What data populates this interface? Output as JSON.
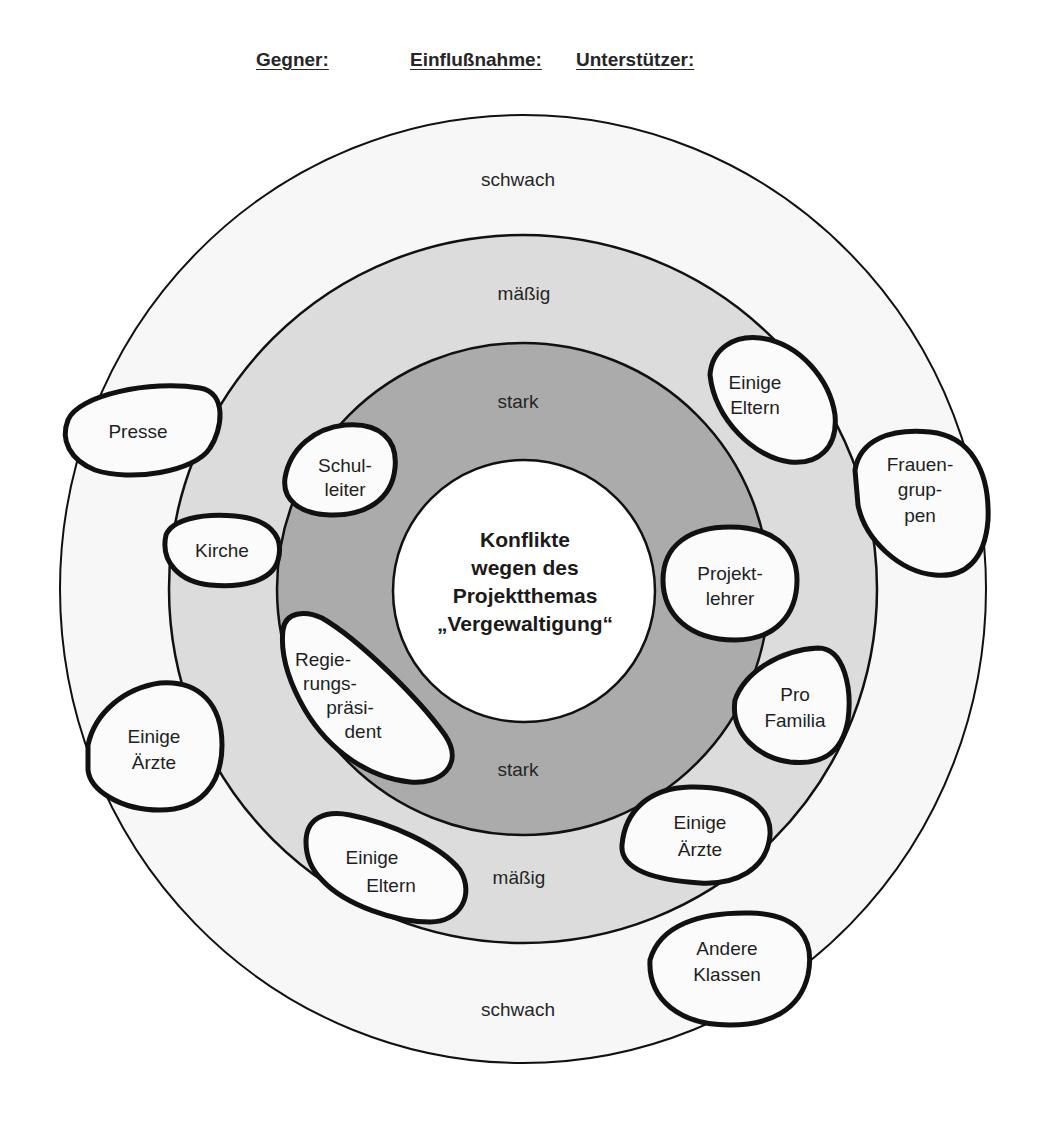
{
  "header": {
    "gegner": "Gegner:",
    "einflussnahme": "Einflußnahme:",
    "unterstuetzer": "Unterstützer:"
  },
  "rings": {
    "outer": "schwach",
    "middle": "mäßig",
    "inner": "stark",
    "outer_bottom": "schwach",
    "middle_bottom": "mäßig",
    "inner_bottom": "stark"
  },
  "center": {
    "lines": [
      "Konflikte",
      "wegen des",
      "Projektthemas",
      "„Vergewaltigung“"
    ]
  },
  "colors": {
    "ring_schwach": "#f7f7f7",
    "ring_maessig": "#dcdcdc",
    "ring_stark": "#ababab",
    "center": "#ffffff",
    "blob_fill": "#fbfbfb",
    "outline": "#111111"
  },
  "actors": {
    "opponents": [
      {
        "id": "presse",
        "lines": [
          "Presse"
        ],
        "influence": "schwach"
      },
      {
        "id": "kirche",
        "lines": [
          "Kirche"
        ],
        "influence": "mäßig"
      },
      {
        "id": "schulleiter",
        "lines": [
          "Schul-",
          "leiter"
        ],
        "influence": "stark"
      },
      {
        "id": "regierungspraesident",
        "lines": [
          "Regie-",
          "rungs-",
          "präsi-",
          "dent"
        ],
        "influence": "stark"
      },
      {
        "id": "einige-aerzte-left",
        "lines": [
          "Einige",
          "Ärzte"
        ],
        "influence": "schwach"
      },
      {
        "id": "einige-eltern-left",
        "lines": [
          "Einige",
          "Eltern"
        ],
        "influence": "mäßig"
      }
    ],
    "supporters": [
      {
        "id": "einige-eltern-right",
        "lines": [
          "Einige",
          "Eltern"
        ],
        "influence": "mäßig"
      },
      {
        "id": "frauengruppen",
        "lines": [
          "Frauen-",
          "grup-",
          "pen"
        ],
        "influence": "schwach"
      },
      {
        "id": "projektlehrer",
        "lines": [
          "Projekt-",
          "lehrer"
        ],
        "influence": "stark"
      },
      {
        "id": "pro-familia",
        "lines": [
          "Pro",
          "Familia"
        ],
        "influence": "mäßig"
      },
      {
        "id": "einige-aerzte-right",
        "lines": [
          "Einige",
          "Ärzte"
        ],
        "influence": "mäßig"
      },
      {
        "id": "andere-klassen",
        "lines": [
          "Andere",
          "Klassen"
        ],
        "influence": "schwach"
      }
    ]
  }
}
